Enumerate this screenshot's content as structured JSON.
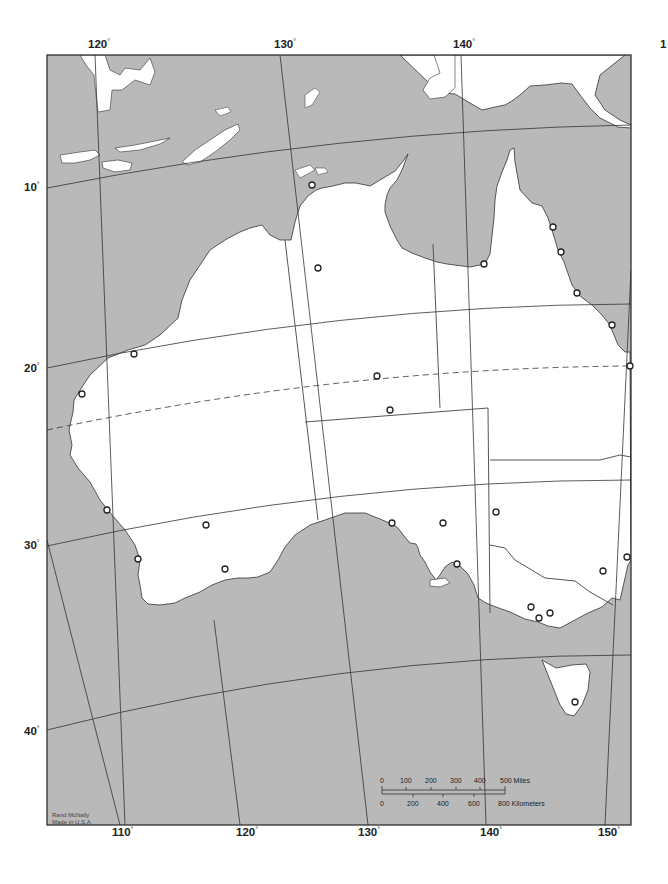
{
  "map": {
    "title": "Australia outline map",
    "colors": {
      "water": "#b9b9b9",
      "land": "#ffffff",
      "frame": "#222222",
      "grid": "#333333",
      "text": "#222222"
    },
    "longitude_labels_top": [
      {
        "value": "120",
        "x": 88
      },
      {
        "value": "130",
        "x": 274
      },
      {
        "value": "140",
        "x": 453
      },
      {
        "value": "1",
        "x": 660
      }
    ],
    "longitude_labels_bottom": [
      {
        "value": "110",
        "x": 112
      },
      {
        "value": "120",
        "x": 236
      },
      {
        "value": "130",
        "x": 358
      },
      {
        "value": "140",
        "x": 480
      },
      {
        "value": "150",
        "x": 598
      }
    ],
    "latitude_labels": [
      {
        "value": "10",
        "y": 188
      },
      {
        "value": "20",
        "y": 370
      },
      {
        "value": "30",
        "y": 546
      },
      {
        "value": "40",
        "y": 732
      }
    ],
    "degree_symbol": "°",
    "scale_bar": {
      "miles_ticks": [
        "0",
        "100",
        "200",
        "300",
        "400"
      ],
      "miles_end": "500 Miles",
      "km_ticks": [
        "0",
        "200",
        "400",
        "600"
      ],
      "km_end": "800 Kilometers"
    },
    "credit": {
      "line1": "Rand McNally",
      "line2": "Made in U.S.A."
    },
    "tropic_line": "dashed (Tropic of Capricorn)",
    "city_markers": [
      {
        "x": 312,
        "y": 185
      },
      {
        "x": 318,
        "y": 268
      },
      {
        "x": 484,
        "y": 264
      },
      {
        "x": 553,
        "y": 227
      },
      {
        "x": 561,
        "y": 252
      },
      {
        "x": 577,
        "y": 293
      },
      {
        "x": 612,
        "y": 325
      },
      {
        "x": 630,
        "y": 366
      },
      {
        "x": 134,
        "y": 354
      },
      {
        "x": 82,
        "y": 394
      },
      {
        "x": 377,
        "y": 376
      },
      {
        "x": 390,
        "y": 410
      },
      {
        "x": 107,
        "y": 510
      },
      {
        "x": 206,
        "y": 525
      },
      {
        "x": 138,
        "y": 559
      },
      {
        "x": 225,
        "y": 569
      },
      {
        "x": 392,
        "y": 523
      },
      {
        "x": 443,
        "y": 523
      },
      {
        "x": 457,
        "y": 564
      },
      {
        "x": 496,
        "y": 512
      },
      {
        "x": 603,
        "y": 571
      },
      {
        "x": 627,
        "y": 557
      },
      {
        "x": 531,
        "y": 607
      },
      {
        "x": 550,
        "y": 613
      },
      {
        "x": 539,
        "y": 618
      },
      {
        "x": 575,
        "y": 702
      }
    ]
  }
}
